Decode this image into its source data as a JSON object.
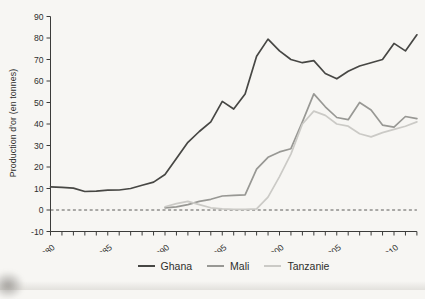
{
  "figure": {
    "background": "#f7f6f3",
    "axis_color": "#3c3c3a",
    "text_color": "#2e2e2c",
    "zero_line_color": "#4a4a48"
  },
  "chart_data": {
    "type": "line",
    "title": "",
    "xlabel": "",
    "ylabel": "Production d'or (en tonnes)",
    "ylim": [
      -10,
      90
    ],
    "y_ticks": [
      -10,
      0,
      10,
      20,
      30,
      40,
      50,
      60,
      70,
      80,
      90
    ],
    "x_range": [
      1980,
      2012
    ],
    "x_labeled_ticks": [
      1980,
      1985,
      1990,
      1995,
      2000,
      2005,
      2010
    ],
    "grid": "off",
    "zero_baseline": "dashed",
    "legend_position": "bottom-center",
    "series": [
      {
        "name": "Ghana",
        "color": "#474744",
        "start_year": 1980,
        "values": [
          10.8,
          10.5,
          10.2,
          8.6,
          8.8,
          9.2,
          9.3,
          10,
          11.5,
          13,
          16.5,
          24,
          31.5,
          36.5,
          41,
          50.5,
          47,
          54,
          71.5,
          79.5,
          74,
          70,
          68.5,
          69.5,
          63.5,
          61,
          64.5,
          67,
          68.5,
          70,
          77.5,
          74,
          81.5
        ]
      },
      {
        "name": "Mali",
        "color": "#989894",
        "start_year": 1990,
        "values": [
          1,
          1.5,
          2.5,
          4,
          5,
          6.5,
          6.8,
          7,
          19,
          24.5,
          27,
          28.5,
          41,
          54,
          48,
          43,
          42,
          50,
          46.5,
          39.5,
          38.5,
          43.5,
          42.5
        ]
      },
      {
        "name": "Tanzanie",
        "color": "#cbcac6",
        "start_year": 1990,
        "values": [
          1.5,
          3,
          4,
          2.5,
          1,
          0.5,
          0.3,
          0.3,
          0.5,
          6,
          15.5,
          26,
          40,
          46,
          44,
          40,
          39,
          35.5,
          34,
          36,
          37.5,
          39,
          41
        ]
      }
    ]
  }
}
